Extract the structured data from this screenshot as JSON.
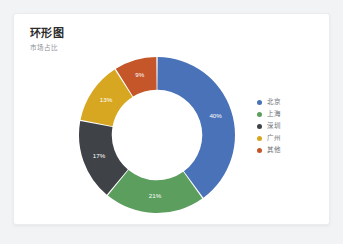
{
  "card": {
    "title": "环形图",
    "subtitle": "市场占比",
    "background": "#ffffff",
    "border_color": "#ebecee"
  },
  "page": {
    "background": "#f2f3f4"
  },
  "chart_data": {
    "type": "pie",
    "variant": "donut",
    "title": "环形图",
    "subtitle": "市场占比",
    "categories": [
      "北京",
      "上海",
      "深圳",
      "广州",
      "其他"
    ],
    "values": [
      40,
      21,
      17,
      13,
      9
    ],
    "value_labels": [
      "40%",
      "21%",
      "17%",
      "13%",
      "9%"
    ],
    "unit": "%",
    "colors": [
      "#4a72b8",
      "#5c9e5e",
      "#3f4247",
      "#d7a722",
      "#c4562a"
    ],
    "legend_position": "right",
    "grid": false,
    "inner_radius_ratio": 0.58,
    "start_angle": 0,
    "slices": [
      {
        "label": "北京",
        "value": 40,
        "display": "40%",
        "color": "#4a72b8"
      },
      {
        "label": "上海",
        "value": 21,
        "display": "21%",
        "color": "#5c9e5e"
      },
      {
        "label": "深圳",
        "value": 17,
        "display": "17%",
        "color": "#3f4247"
      },
      {
        "label": "广州",
        "value": 13,
        "display": "13%",
        "color": "#d7a722"
      },
      {
        "label": "其他",
        "value": 9,
        "display": "9%",
        "color": "#c4562a"
      }
    ]
  },
  "legend": {
    "items": [
      {
        "label": "北京",
        "color": "#4a72b8"
      },
      {
        "label": "上海",
        "color": "#5c9e5e"
      },
      {
        "label": "深圳",
        "color": "#3f4247"
      },
      {
        "label": "广州",
        "color": "#d7a722"
      },
      {
        "label": "其他",
        "color": "#c4562a"
      }
    ]
  }
}
